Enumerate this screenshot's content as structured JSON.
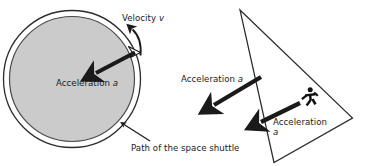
{
  "figure": {
    "colors": {
      "stroke": "#2b2b2b",
      "arrow": "#1a1a1a",
      "orbit_fill": "#cccccc",
      "background": "#ffffff"
    }
  },
  "left_diagram": {
    "name": "space-shuttle-orbit",
    "labels": {
      "velocity": {
        "text": "Velocity ",
        "symbol": "v"
      },
      "acceleration": {
        "text": "Acceleration ",
        "symbol": "a"
      },
      "path": {
        "text": "Path of the space shuttle"
      }
    },
    "shapes": {
      "outer_circle": {
        "cx": 72,
        "cy": 79,
        "r": 68
      },
      "inner_circle": {
        "cx": 72,
        "cy": 79,
        "r": 63,
        "fill": "#cccccc"
      },
      "shuttle_marker": {
        "x": 134,
        "y": 50
      }
    },
    "arrows": {
      "acceleration": {
        "from_x": 136,
        "from_y": 53,
        "to_x": 94,
        "to_y": 74
      },
      "velocity": {
        "type": "curved-tangent",
        "tip_x": 132,
        "tip_y": 28
      },
      "path_leader": {
        "from_x": 149,
        "from_y": 140,
        "to_x": 122,
        "to_y": 123
      }
    }
  },
  "right_diagram": {
    "name": "runner-on-ramp",
    "labels": {
      "acceleration_left": {
        "text": "Acceleration ",
        "symbol": "a"
      },
      "acceleration_right": {
        "text": "Acceleration",
        "symbol": "a"
      }
    },
    "shapes": {
      "triangle": {
        "apex_x": 240,
        "apex_y": 10,
        "right_x": 352,
        "right_y": 118,
        "bottom_x": 274,
        "bottom_y": 162
      },
      "runner_icon": {
        "x": 303,
        "y": 97
      }
    },
    "arrows": {
      "acceleration_left": {
        "from_x": 261,
        "from_y": 77,
        "to_x": 212,
        "to_y": 106
      },
      "acceleration_right": {
        "from_x": 300,
        "from_y": 103,
        "to_x": 259,
        "to_y": 123
      }
    }
  }
}
